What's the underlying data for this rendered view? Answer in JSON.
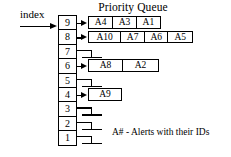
{
  "figure": {
    "title": "Priority Queue",
    "index_label": "index",
    "caption": "A# - Alerts with their IDs",
    "colors": {
      "ink": "#000000",
      "background": "#ffffff"
    },
    "index_column": {
      "name": "priority-index-column",
      "values": [
        "9",
        "8",
        "7",
        "6",
        "5",
        "4",
        "3",
        "2",
        "1"
      ]
    },
    "rows": [
      {
        "index": "9",
        "pointer": "arrow",
        "nodes": [
          "A4",
          "A3",
          "A1"
        ]
      },
      {
        "index": "8",
        "pointer": "arrow",
        "nodes": [
          "A10",
          "A7",
          "A6",
          "A5"
        ]
      },
      {
        "index": "7",
        "pointer": "null",
        "nodes": []
      },
      {
        "index": "6",
        "pointer": "arrow",
        "nodes": [
          "A8",
          "A2"
        ]
      },
      {
        "index": "5",
        "pointer": "null",
        "nodes": []
      },
      {
        "index": "4",
        "pointer": "arrow",
        "nodes": [
          "A9"
        ]
      },
      {
        "index": "3",
        "pointer": "null",
        "nodes": []
      },
      {
        "index": "2",
        "pointer": "null",
        "nodes": []
      },
      {
        "index": "1",
        "pointer": "null",
        "nodes": []
      }
    ]
  }
}
